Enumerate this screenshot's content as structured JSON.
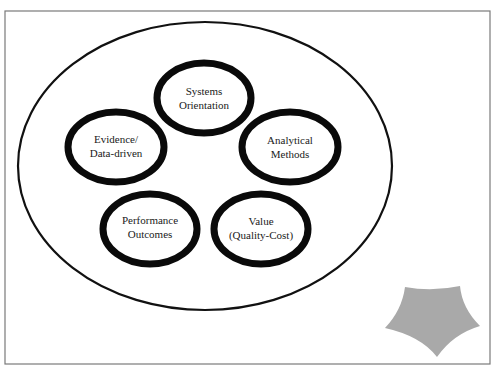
{
  "diagram": {
    "frame": {
      "x": 5,
      "y": 11,
      "width": 485,
      "height": 353,
      "stroke": "#7a7a7a"
    },
    "outer_ellipse": {
      "cx": 205,
      "cy": 166,
      "rx": 187,
      "ry": 144,
      "stroke": "#111111"
    },
    "nodes": [
      {
        "id": "systems-orientation",
        "line1": "Systems",
        "line2": "Orientation",
        "cx": 204,
        "cy": 98
      },
      {
        "id": "evidence-data-driven",
        "line1": "Evidence/",
        "line2": "Data-driven",
        "cx": 116,
        "cy": 147
      },
      {
        "id": "analytical-methods",
        "line1": "Analytical",
        "line2": "Methods",
        "cx": 290,
        "cy": 147
      },
      {
        "id": "performance-outcomes",
        "line1": "Performance",
        "line2": "Outcomes",
        "cx": 150,
        "cy": 229
      },
      {
        "id": "value-quality-cost",
        "line1": "Value",
        "line2": "(Quality-Cost)",
        "cx": 261,
        "cy": 229
      }
    ],
    "star": {
      "fill": "#a9a9a9",
      "icon": "pentagon-star-icon"
    }
  }
}
